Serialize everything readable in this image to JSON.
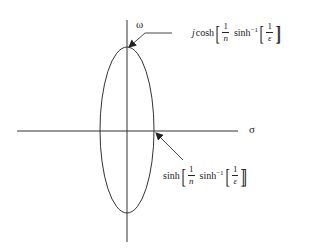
{
  "diagram": {
    "axes": {
      "vertical_label": "ω",
      "horizontal_label": "σ"
    },
    "top_annotation": {
      "prefix": "j",
      "func": "cosh",
      "frac1_num": "1",
      "frac1_den": "n",
      "inner_func": "sinh",
      "inner_sup": "−1",
      "frac2_num": "1",
      "frac2_den": "ε"
    },
    "right_annotation": {
      "func": "sinh",
      "frac1_num": "1",
      "frac1_den": "n",
      "inner_func": "sinh",
      "inner_sup": "−1",
      "frac2_num": "1",
      "frac2_den": "ε"
    },
    "colors": {
      "stroke": "#333333",
      "background": "#ffffff"
    }
  }
}
